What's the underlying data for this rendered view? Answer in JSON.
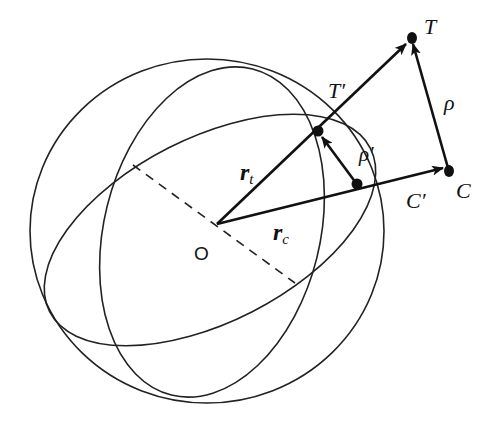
{
  "diagram": {
    "labels": {
      "origin": "O",
      "target": "T",
      "target_projection": "T′",
      "chaser": "C",
      "chaser_projection": "C′",
      "relative": "ρ",
      "relative_projection": "ρ′",
      "r_t_main": "r",
      "r_t_sub": "t",
      "r_c_main": "r",
      "r_c_sub": "c"
    },
    "colors": {
      "ink": "#111111",
      "background": "#ffffff"
    }
  }
}
